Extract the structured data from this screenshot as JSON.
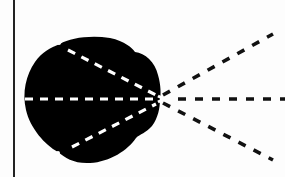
{
  "diagram": {
    "colors": {
      "background": "#fdfdfd",
      "blob": "#000000",
      "inner_dash": "#ffffff",
      "outer_dash": "#111111",
      "border_line": "#222222"
    },
    "focal_point": {
      "x": 160,
      "y": 99
    },
    "rays": [
      {
        "name": "upper",
        "inner_start": [
          60,
          45
        ],
        "outer_end": [
          273,
          34
        ]
      },
      {
        "name": "middle",
        "inner_start": [
          25,
          99
        ],
        "outer_end": [
          284,
          99
        ]
      },
      {
        "name": "lower",
        "inner_start": [
          58,
          152
        ],
        "outer_end": [
          273,
          160
        ]
      }
    ]
  }
}
